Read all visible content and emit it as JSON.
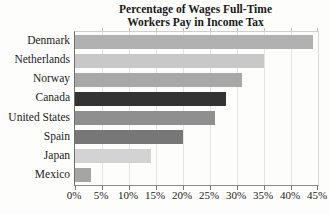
{
  "chart_data": {
    "type": "bar",
    "orientation": "horizontal",
    "title": "Percentage of Wages Full-Time Workers Pay in Income Tax",
    "title_lines": [
      "Percentage of Wages Full-Time",
      "Workers Pay in Income Tax"
    ],
    "categories": [
      "Denmark",
      "Netherlands",
      "Norway",
      "Canada",
      "United States",
      "Spain",
      "Japan",
      "Mexico"
    ],
    "values": [
      44,
      35,
      31,
      28,
      26,
      20,
      14,
      3
    ],
    "value_unit": "%",
    "bar_colors": [
      "#b1b1b1",
      "#c8c8c8",
      "#a8a8a8",
      "#333333",
      "#8f8f8f",
      "#777777",
      "#d3d3d3",
      "#a5a5a5"
    ],
    "highlighted_category": "Canada",
    "xlabel": "",
    "ylabel": "",
    "xlim": [
      0,
      45
    ],
    "x_ticks": [
      0,
      5,
      10,
      15,
      20,
      25,
      30,
      35,
      40,
      45
    ],
    "x_tick_labels": [
      "0%",
      "5%",
      "10%",
      "15%",
      "20%",
      "25%",
      "30%",
      "35%",
      "40%",
      "45%"
    ],
    "grid": "vertical",
    "grid_color": "#e5e5e7",
    "axis_color": "#6f6f6f",
    "legend": "none"
  }
}
